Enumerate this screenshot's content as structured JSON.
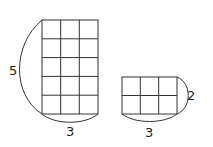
{
  "figures": [
    {
      "name": "tall-grid",
      "rows": 5,
      "cols": 3,
      "height_label": "5",
      "width_label": "3"
    },
    {
      "name": "wide-grid",
      "rows": 2,
      "cols": 3,
      "height_label": "2",
      "width_label": "3"
    }
  ],
  "colors": {
    "stroke": "#333333",
    "text": "#222222",
    "background": "#ffffff"
  }
}
